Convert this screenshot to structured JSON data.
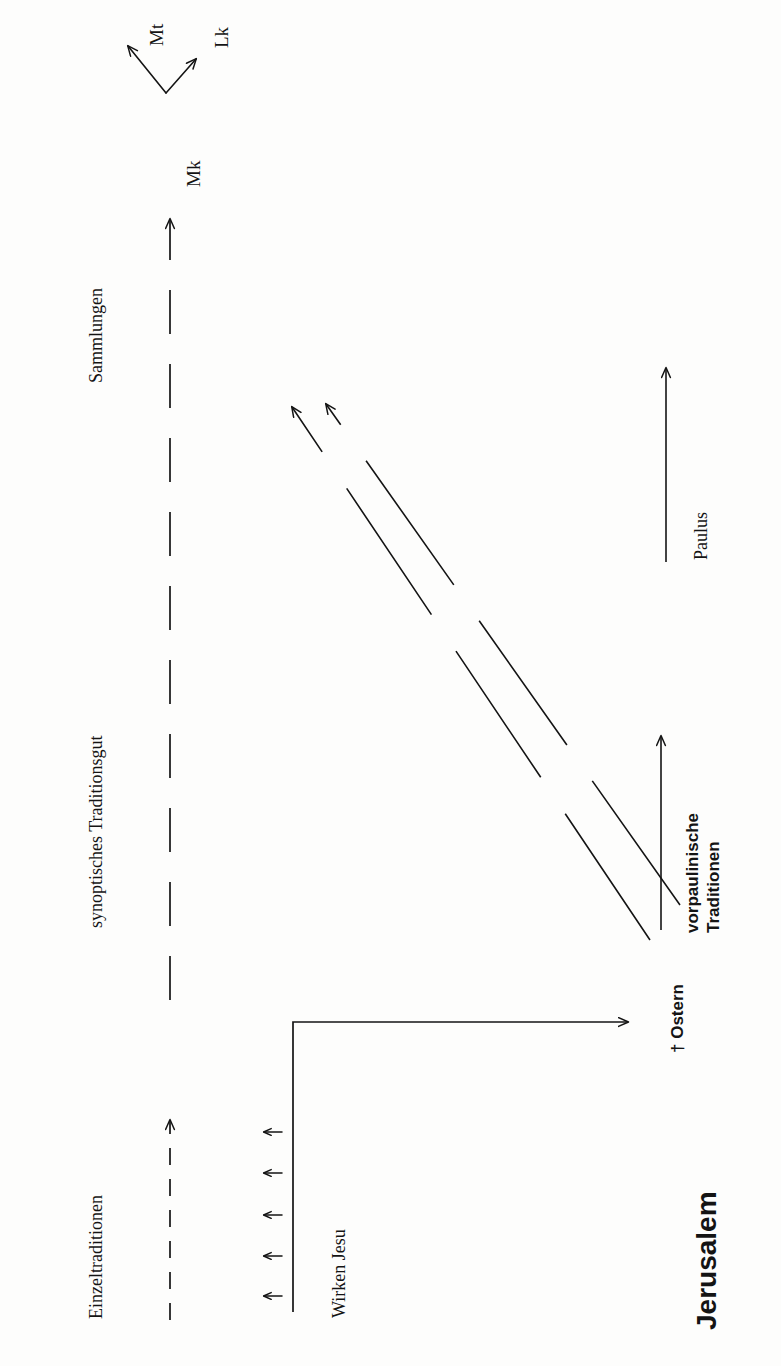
{
  "figure": {
    "orientation": "text rotated 90 degrees (landscape diagram on a portrait page)",
    "background_color": "#fdfdfc",
    "ink_color": "#141414"
  },
  "labels": {
    "mt": "Mt",
    "lk": "Lk",
    "mk": "Mk",
    "sammlungen": "Sammlungen",
    "synoptisches_traditionsgut": "synoptisches Traditionsgut",
    "einzeltraditionen": "Einzeltraditionen",
    "wirken_jesu": "Wirken Jesu",
    "jerusalem": "Jerusalem",
    "ostern": "† Ostern",
    "paulus": "Paulus",
    "vorpaulinische_line1": "vorpaulinische",
    "vorpaulinische_line2": "Traditionen"
  },
  "arrows": {
    "mk_to_mt": "solid arrow from Mk branching up-left to Mt",
    "mk_to_lk": "solid arrow from Mk branching up-right to Lk",
    "tradition_stream": "long dashed arrow pointing toward Mk",
    "einzeltraditionen_stream": "short dashed arrow pointing along the tradition axis",
    "jesus_timeline": "solid L-shaped timeline arrow ending at Ostern",
    "small_feed_arrows_count": 5,
    "vorpaulinische_arrow": "solid arrow along the vorpaulinische Traditionen axis",
    "paulus_arrow": "solid arrow along the Paulus axis",
    "diagonal_dashed_arrows_count": 2
  },
  "icons": {
    "cross": "†"
  }
}
